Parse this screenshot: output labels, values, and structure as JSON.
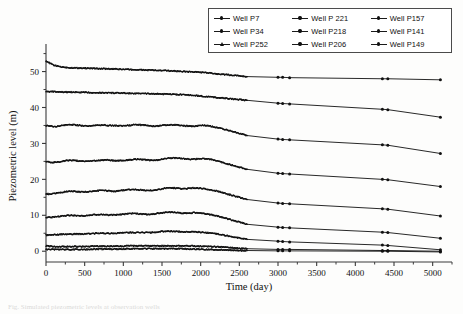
{
  "figure": {
    "background": "#fdfdfc",
    "axis_color": "#3a3a3a",
    "series_color": "#111111"
  },
  "legend": {
    "position": "top-right",
    "border_color": "#4a4a4a",
    "entries": [
      {
        "label": "Well P7",
        "marker": "dot"
      },
      {
        "label": "Well P 221",
        "marker": "dot"
      },
      {
        "label": "Well P157",
        "marker": "dot"
      },
      {
        "label": "Well P34",
        "marker": "dot"
      },
      {
        "label": "Well P218",
        "marker": "dot"
      },
      {
        "label": "Well P141",
        "marker": "dot"
      },
      {
        "label": "Well P252",
        "marker": "triangle"
      },
      {
        "label": "Well P206",
        "marker": "dot"
      },
      {
        "label": "Well P149",
        "marker": "dot"
      }
    ]
  },
  "caption": {
    "text": "Fig. Simulated piezometric levels at observation wells"
  },
  "chart_data": {
    "type": "line",
    "title": "",
    "xlabel": "Time (day)",
    "ylabel": "Piezometric level (m)",
    "xlim": [
      0,
      5250
    ],
    "ylim": [
      -3,
      56
    ],
    "xticks": [
      0,
      500,
      1000,
      1500,
      2000,
      2500,
      3000,
      3500,
      4000,
      4500,
      5000
    ],
    "yticks": [
      0,
      10,
      20,
      30,
      40,
      50
    ],
    "grid": false,
    "legend_position": "top-right",
    "note": "Dense daily sampling to about day 2600, sparse points thereafter at roughly 3000, 3050, 3150, 4350, 4400 and 5100 days.",
    "x_dense": [
      0,
      50,
      100,
      150,
      200,
      250,
      300,
      350,
      400,
      450,
      500,
      550,
      600,
      650,
      700,
      750,
      800,
      850,
      900,
      950,
      1000,
      1050,
      1100,
      1150,
      1200,
      1250,
      1300,
      1350,
      1400,
      1450,
      1500,
      1550,
      1600,
      1650,
      1700,
      1750,
      1800,
      1850,
      1900,
      1950,
      2000,
      2050,
      2100,
      2150,
      2200,
      2250,
      2300,
      2350,
      2400,
      2450,
      2500,
      2550,
      2600
    ],
    "x_sparse": [
      2600,
      3000,
      3060,
      3150,
      4350,
      4420,
      5100
    ],
    "series": [
      {
        "name": "Well P7",
        "values_dense": [
          53.0,
          52.3,
          51.8,
          51.5,
          51.3,
          51.2,
          51.1,
          51.05,
          51.0,
          51.0,
          50.95,
          50.9,
          50.9,
          50.85,
          50.8,
          50.8,
          50.75,
          50.7,
          50.7,
          50.65,
          50.6,
          50.6,
          50.55,
          50.5,
          50.5,
          50.45,
          50.4,
          50.4,
          50.35,
          50.3,
          50.3,
          50.25,
          50.2,
          50.2,
          50.1,
          50.05,
          50.0,
          49.95,
          49.9,
          49.85,
          49.8,
          49.7,
          49.6,
          49.5,
          49.4,
          49.3,
          49.2,
          49.1,
          49.0,
          48.9,
          48.8,
          48.7,
          48.6
        ],
        "values_sparse": [
          48.6,
          48.4,
          48.4,
          48.3,
          48.0,
          48.0,
          47.7
        ]
      },
      {
        "name": "Well P34",
        "values_dense": [
          44.5,
          44.4,
          44.4,
          44.35,
          44.3,
          44.3,
          44.3,
          44.25,
          44.25,
          44.2,
          44.2,
          44.2,
          44.15,
          44.15,
          44.1,
          44.1,
          44.1,
          44.05,
          44.05,
          44.0,
          44.0,
          44.0,
          43.95,
          43.95,
          43.9,
          43.9,
          43.85,
          43.85,
          43.8,
          43.8,
          43.75,
          43.7,
          43.7,
          43.65,
          43.6,
          43.6,
          43.5,
          43.45,
          43.4,
          43.3,
          43.2,
          43.1,
          43.0,
          42.9,
          42.8,
          42.7,
          42.6,
          42.5,
          42.4,
          42.3,
          42.2,
          42.1,
          42.0
        ],
        "values_sparse": [
          42.0,
          41.2,
          41.1,
          41.0,
          39.5,
          39.4,
          37.3
        ]
      },
      {
        "name": "Well P252",
        "values_dense": [
          35.0,
          34.8,
          34.7,
          34.8,
          35.0,
          35.1,
          35.2,
          35.2,
          35.1,
          35.0,
          34.9,
          34.9,
          34.95,
          35.05,
          35.1,
          35.1,
          35.05,
          35.0,
          34.95,
          34.9,
          34.9,
          35.0,
          35.1,
          35.2,
          35.2,
          35.1,
          35.0,
          34.9,
          34.85,
          34.9,
          35.0,
          35.1,
          35.2,
          35.2,
          35.1,
          35.0,
          34.9,
          34.8,
          34.8,
          34.9,
          35.0,
          35.0,
          34.9,
          34.7,
          34.5,
          34.3,
          34.0,
          33.7,
          33.4,
          33.1,
          32.8,
          32.5,
          32.2
        ],
        "values_sparse": [
          32.2,
          31.2,
          31.1,
          31.0,
          29.6,
          29.5,
          27.2
        ]
      },
      {
        "name": "Well P 221",
        "values_dense": [
          25.0,
          24.8,
          24.7,
          24.8,
          25.0,
          25.2,
          25.3,
          25.3,
          25.2,
          25.1,
          25.0,
          25.0,
          25.1,
          25.2,
          25.3,
          25.4,
          25.4,
          25.3,
          25.2,
          25.2,
          25.3,
          25.4,
          25.5,
          25.6,
          25.6,
          25.5,
          25.4,
          25.3,
          25.3,
          25.4,
          25.6,
          25.8,
          25.9,
          26.0,
          25.9,
          25.8,
          25.7,
          25.6,
          25.6,
          25.7,
          25.8,
          25.8,
          25.7,
          25.5,
          25.2,
          24.9,
          24.6,
          24.3,
          24.0,
          23.7,
          23.4,
          23.1,
          22.8
        ],
        "values_sparse": [
          22.8,
          21.7,
          21.6,
          21.5,
          20.0,
          19.9,
          18.0
        ]
      },
      {
        "name": "Well P218",
        "values_dense": [
          16.0,
          15.9,
          16.0,
          16.2,
          16.4,
          16.6,
          16.7,
          16.7,
          16.6,
          16.5,
          16.5,
          16.6,
          16.7,
          16.8,
          16.9,
          16.9,
          16.8,
          16.7,
          16.7,
          16.8,
          17.0,
          17.1,
          17.2,
          17.2,
          17.1,
          17.0,
          16.9,
          16.9,
          17.0,
          17.2,
          17.4,
          17.6,
          17.7,
          17.6,
          17.5,
          17.4,
          17.4,
          17.5,
          17.6,
          17.6,
          17.5,
          17.4,
          17.2,
          17.0,
          16.8,
          16.5,
          16.2,
          15.9,
          15.6,
          15.3,
          15.0,
          14.7,
          14.4
        ],
        "values_sparse": [
          14.4,
          13.4,
          13.3,
          13.2,
          11.8,
          11.7,
          9.8
        ]
      },
      {
        "name": "Well P206",
        "values_dense": [
          9.5,
          9.4,
          9.5,
          9.6,
          9.8,
          9.9,
          10.0,
          10.0,
          9.9,
          9.9,
          9.9,
          10.0,
          10.1,
          10.2,
          10.2,
          10.2,
          10.1,
          10.1,
          10.1,
          10.2,
          10.3,
          10.4,
          10.5,
          10.5,
          10.4,
          10.3,
          10.3,
          10.3,
          10.4,
          10.6,
          10.7,
          10.8,
          10.9,
          10.8,
          10.7,
          10.6,
          10.6,
          10.6,
          10.7,
          10.7,
          10.6,
          10.5,
          10.3,
          10.1,
          9.9,
          9.6,
          9.3,
          9.0,
          8.7,
          8.4,
          8.1,
          7.8,
          7.5
        ],
        "values_sparse": [
          7.5,
          6.7,
          6.6,
          6.5,
          5.3,
          5.2,
          3.6
        ]
      },
      {
        "name": "Well P157",
        "values_dense": [
          4.5,
          4.5,
          4.6,
          4.6,
          4.7,
          4.7,
          4.8,
          4.8,
          4.8,
          4.8,
          4.8,
          4.9,
          4.9,
          5.0,
          5.0,
          5.0,
          5.0,
          5.0,
          5.0,
          5.1,
          5.1,
          5.2,
          5.2,
          5.2,
          5.2,
          5.2,
          5.2,
          5.2,
          5.3,
          5.4,
          5.5,
          5.5,
          5.6,
          5.5,
          5.5,
          5.4,
          5.4,
          5.4,
          5.4,
          5.4,
          5.3,
          5.2,
          5.1,
          5.0,
          4.9,
          4.7,
          4.5,
          4.3,
          4.1,
          3.9,
          3.7,
          3.5,
          3.3
        ],
        "values_sparse": [
          3.3,
          2.8,
          2.7,
          2.6,
          1.7,
          1.6,
          0.4
        ]
      },
      {
        "name": "Well P141",
        "values_dense": [
          1.5,
          1.4,
          1.3,
          1.3,
          1.3,
          1.3,
          1.3,
          1.3,
          1.3,
          1.3,
          1.3,
          1.3,
          1.4,
          1.4,
          1.4,
          1.4,
          1.4,
          1.4,
          1.4,
          1.4,
          1.4,
          1.5,
          1.5,
          1.5,
          1.5,
          1.5,
          1.5,
          1.5,
          1.5,
          1.5,
          1.5,
          1.5,
          1.5,
          1.5,
          1.5,
          1.5,
          1.5,
          1.5,
          1.5,
          1.4,
          1.4,
          1.4,
          1.3,
          1.3,
          1.2,
          1.2,
          1.1,
          1.0,
          1.0,
          0.9,
          0.8,
          0.8,
          0.7
        ],
        "values_sparse": [
          0.7,
          0.5,
          0.5,
          0.5,
          0.2,
          0.2,
          0.0
        ]
      },
      {
        "name": "Well P149",
        "values_dense": [
          0.6,
          0.5,
          0.5,
          0.5,
          0.5,
          0.5,
          0.5,
          0.5,
          0.5,
          0.5,
          0.5,
          0.5,
          0.6,
          0.6,
          0.6,
          0.6,
          0.6,
          0.6,
          0.6,
          0.6,
          0.6,
          0.7,
          0.7,
          0.7,
          0.7,
          0.7,
          0.7,
          0.7,
          0.7,
          0.7,
          0.7,
          0.7,
          0.7,
          0.7,
          0.7,
          0.7,
          0.7,
          0.6,
          0.6,
          0.6,
          0.6,
          0.5,
          0.5,
          0.5,
          0.4,
          0.4,
          0.4,
          0.3,
          0.3,
          0.3,
          0.2,
          0.2,
          0.2
        ],
        "values_sparse": [
          0.2,
          0.1,
          0.1,
          0.1,
          0.0,
          0.0,
          -0.2
        ]
      }
    ]
  }
}
